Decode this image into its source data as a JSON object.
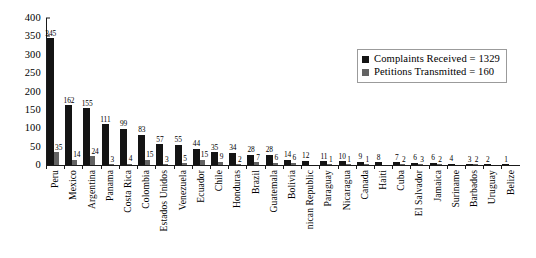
{
  "chart_data": {
    "type": "bar",
    "title": "",
    "subtitle": "",
    "xlabel": "",
    "ylabel": "",
    "ylim": [
      0,
      400
    ],
    "yticks": [
      0,
      50,
      100,
      150,
      200,
      250,
      300,
      350,
      400
    ],
    "grid": false,
    "legend_position": "top-right",
    "categories": [
      "Peru",
      "Mexico",
      "Argentina",
      "Panama",
      "Costa Rica",
      "Colombia",
      "Estados Unidos",
      "Venezuela",
      "Ecuador",
      "Chile",
      "Honduras",
      "Brazil",
      "Guatemala",
      "Bolivia",
      "nican Republic",
      "Paraguay",
      "Nicaragua",
      "Canada",
      "Haiti",
      "Cuba",
      "El Salvador",
      "Jamaica",
      "Suriname",
      "Barbados",
      "Uruguay",
      "Belize"
    ],
    "series": [
      {
        "name": "Complaints Received",
        "total": 1329,
        "color": "#141414",
        "values": [
          345,
          162,
          155,
          111,
          99,
          83,
          57,
          55,
          44,
          35,
          34,
          28,
          28,
          14,
          12,
          11,
          10,
          9,
          8,
          7,
          6,
          6,
          4,
          3,
          2,
          1
        ]
      },
      {
        "name": "Petitions Transmitted",
        "total": 160,
        "color": "#636363",
        "values": [
          35,
          14,
          24,
          3,
          4,
          15,
          3,
          5,
          15,
          9,
          2,
          7,
          6,
          6,
          null,
          1,
          1,
          1,
          null,
          2,
          3,
          2,
          null,
          2,
          null,
          null
        ]
      }
    ]
  },
  "legend": {
    "items": [
      {
        "label": "Complaints Received = 1329",
        "swatch": "complaints"
      },
      {
        "label": "Petitions Transmitted = 160",
        "swatch": "petitions"
      }
    ]
  }
}
